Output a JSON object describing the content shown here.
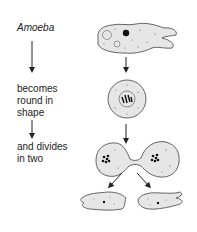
{
  "labels": {
    "organism": "Amoeba",
    "step1_line1": "becomes",
    "step1_line2": "round in",
    "step1_line3": "shape",
    "step2_line1": "and divides",
    "step2_line2": "in two"
  },
  "colors": {
    "cell_fill": "#e6e6e6",
    "outline": "#555555",
    "nucleus": "#111111",
    "text": "#222222"
  }
}
